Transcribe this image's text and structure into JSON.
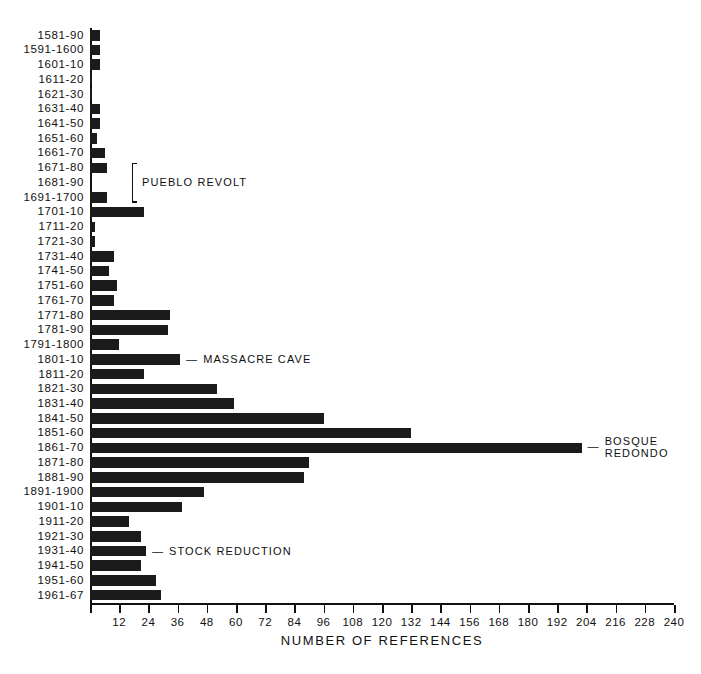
{
  "chart_data": {
    "type": "bar",
    "orientation": "horizontal",
    "title": "",
    "xlabel": "NUMBER OF REFERENCES",
    "ylabel": "",
    "xlim": [
      0,
      240
    ],
    "xticks": [
      0,
      12,
      24,
      36,
      48,
      60,
      72,
      84,
      96,
      108,
      120,
      132,
      144,
      156,
      168,
      180,
      192,
      204,
      216,
      228,
      240
    ],
    "xtick_labels": [
      "",
      "12",
      "24",
      "36",
      "48",
      "60",
      "72",
      "84",
      "96",
      "108",
      "120",
      "132",
      "144",
      "156",
      "168",
      "180",
      "192",
      "204",
      "216",
      "228",
      "240"
    ],
    "grid": false,
    "legend": null,
    "categories": [
      "1581-90",
      "1591-1600",
      "1601-10",
      "1611-20",
      "1621-30",
      "1631-40",
      "1641-50",
      "1651-60",
      "1661-70",
      "1671-80",
      "1681-90",
      "1691-1700",
      "1701-10",
      "1711-20",
      "1721-30",
      "1731-40",
      "1741-50",
      "1751-60",
      "1761-70",
      "1771-80",
      "1781-90",
      "1791-1800",
      "1801-10",
      "1811-20",
      "1821-30",
      "1831-40",
      "1841-50",
      "1851-60",
      "1861-70",
      "1871-80",
      "1881-90",
      "1891-1900",
      "1901-10",
      "1911-20",
      "1921-30",
      "1931-40",
      "1941-50",
      "1951-60",
      "1961-67"
    ],
    "values": [
      4,
      4,
      4,
      1,
      1,
      4,
      4,
      3,
      6,
      7,
      0,
      7,
      22,
      2,
      2,
      10,
      8,
      11,
      10,
      33,
      32,
      12,
      37,
      22,
      52,
      59,
      96,
      132,
      202,
      90,
      88,
      47,
      38,
      16,
      21,
      23,
      21,
      27,
      29
    ],
    "bar_color": "#1b1b1b"
  },
  "annotations": [
    {
      "id": "pueblo-revolt",
      "label": "PUEBLO REVOLT",
      "row_start": 9,
      "row_end": 11,
      "style": "brace"
    },
    {
      "id": "massacre-cave",
      "label": "MASSACRE CAVE",
      "row": 22,
      "style": "dash"
    },
    {
      "id": "bosque-redondo",
      "label_line1": "BOSQUE",
      "label_line2": "REDONDO",
      "row": 28,
      "style": "dash"
    },
    {
      "id": "stock-reduction",
      "label": "STOCK REDUCTION",
      "row": 35,
      "style": "dash"
    }
  ],
  "axis": {
    "x_title": "NUMBER OF REFERENCES"
  },
  "caption": {
    "text": ""
  }
}
